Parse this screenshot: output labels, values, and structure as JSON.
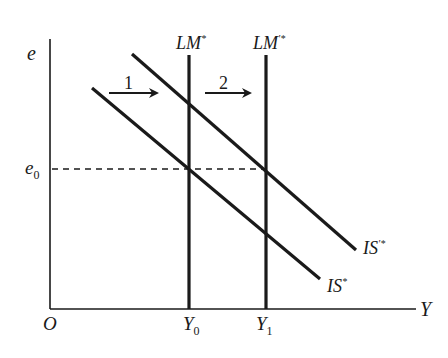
{
  "diagram": {
    "type": "IS-LM (Mundell-Fleming) diagram",
    "axes": {
      "y_label": "e",
      "x_label": "Y",
      "origin_label": "O"
    },
    "levels": {
      "e0": {
        "base": "e",
        "sub": "0"
      },
      "Y0": {
        "base": "Y",
        "sub": "0"
      },
      "Y1": {
        "base": "Y",
        "sub": "1"
      }
    },
    "curves": {
      "lm1": {
        "base": "LM",
        "sup": "*"
      },
      "lm2": {
        "base": "LM",
        "sup": "'*"
      },
      "is1": {
        "base": "IS",
        "sup": "*"
      },
      "is2": {
        "base": "IS",
        "sup": "'*"
      }
    },
    "arrows": {
      "arrow1": "1",
      "arrow2": "2"
    },
    "colors": {
      "ink": "#1a1a1a",
      "background": "#ffffff"
    }
  }
}
